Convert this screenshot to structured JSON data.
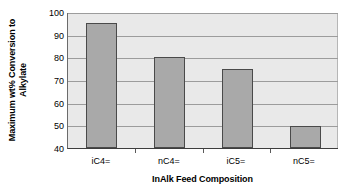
{
  "chart_data": {
    "type": "bar",
    "title": "",
    "categories": [
      "iC4=",
      "nC4=",
      "iC5=",
      "nC5="
    ],
    "values": [
      95,
      80,
      75,
      49.5
    ],
    "series": [
      {
        "name": "Maximum wt% Conversion to Alkylate",
        "values": [
          95,
          80,
          75,
          49.5
        ]
      }
    ],
    "xlabel": "InAlk Feed Composition",
    "ylabel": "Maximum wt% Conversion to Alkylate",
    "ylabel_lines": [
      "Maximum wt% Conversion to",
      "Alkylate"
    ],
    "ylim": [
      40,
      100
    ],
    "yticks": [
      40,
      50,
      60,
      70,
      80,
      90,
      100
    ],
    "ytick_labels": [
      "40",
      "50",
      "60",
      "70",
      "80",
      "90",
      "100"
    ],
    "grid": true,
    "grid_axis": "y",
    "legend": false,
    "legend_position": "none",
    "colors": {
      "bar_fill": "#a9a9a9",
      "bar_edge": "#4a4a4a",
      "plot_background": "#e9e9e9",
      "gridline": "#9c9c9c",
      "axis": "#3d3d3d",
      "text": "#000000",
      "figure_background": "#ffffff"
    }
  }
}
